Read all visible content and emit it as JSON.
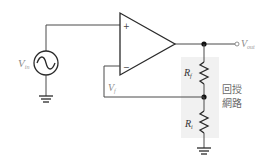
{
  "diagram": {
    "type": "non-inverting op-amp amplifier with feedback network",
    "source": {
      "symbol": "V",
      "subscript": "in"
    },
    "opamp": {
      "plus_label": "+",
      "minus_label": "−"
    },
    "output": {
      "symbol": "V",
      "subscript": "out"
    },
    "feedback_voltage": {
      "symbol": "V",
      "subscript": "f"
    },
    "resistors": [
      {
        "symbol": "R",
        "subscript": "f"
      },
      {
        "symbol": "R",
        "subscript": "i"
      }
    ],
    "feedback_network_label": {
      "line1": "回授",
      "line2": "網路"
    },
    "colors": {
      "wire": "#4a4a4a",
      "shade": "#f1f1f1",
      "label": "#8a8a8a",
      "node": "#111111"
    }
  }
}
